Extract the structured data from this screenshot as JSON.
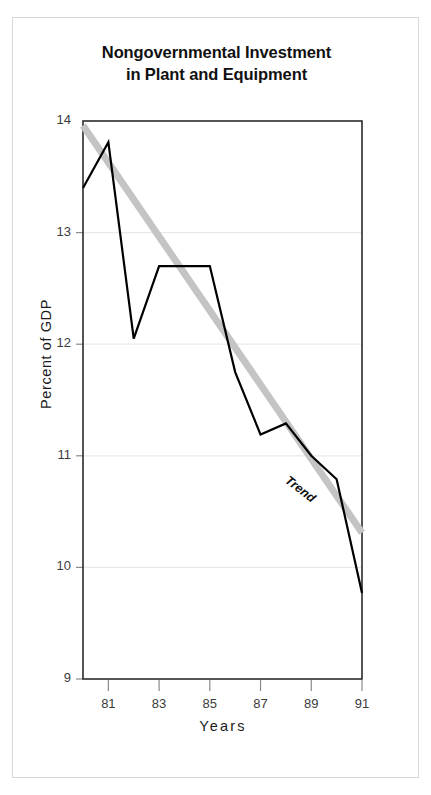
{
  "figure": {
    "title_line1": "Nongovernmental Investment",
    "title_line2": "in Plant and Equipment",
    "border_color": "#d8d8d8",
    "background": "#ffffff"
  },
  "chart_data": {
    "type": "line",
    "title": "Nongovernmental Investment in Plant and Equipment",
    "xlabel": "Years",
    "ylabel": "Percent of GDP",
    "xlim": [
      1980,
      1991
    ],
    "ylim": [
      9,
      14
    ],
    "yticks": [
      9,
      10,
      11,
      12,
      13,
      14
    ],
    "ytick_labels": [
      "9",
      "10",
      "11",
      "12",
      "13",
      "14"
    ],
    "xticks": [
      1981,
      1983,
      1985,
      1987,
      1989,
      1991
    ],
    "xtick_labels": [
      "81",
      "83",
      "85",
      "87",
      "89",
      "91"
    ],
    "grid": "horizontal",
    "legend": "none",
    "x": [
      1980,
      1981,
      1982,
      1983,
      1984,
      1985,
      1986,
      1987,
      1988,
      1989,
      1990,
      1991
    ],
    "series": [
      {
        "name": "Nongovernmental investment",
        "color": "#000000",
        "width": 2.2,
        "values": [
          13.4,
          13.81,
          12.05,
          12.7,
          12.7,
          12.7,
          11.75,
          11.19,
          11.29,
          11.0,
          10.79,
          9.77
        ]
      },
      {
        "name": "Trend",
        "color": "#c4c4c4",
        "width": 7,
        "x": [
          1980,
          1991
        ],
        "values": [
          13.96,
          10.31
        ]
      }
    ],
    "annotations": [
      {
        "text": "Trend",
        "x": 1988.2,
        "y": 10.85,
        "rotation": 38,
        "style": "bold-italic"
      }
    ]
  }
}
